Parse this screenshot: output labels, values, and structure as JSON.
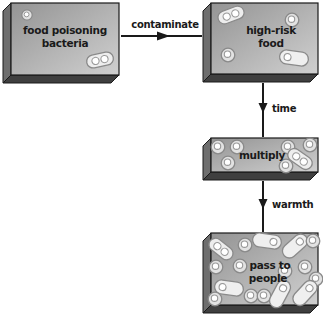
{
  "diagram": {
    "type": "flowchart",
    "nodes": [
      {
        "id": "food-poisoning-bacteria",
        "lines": [
          "food poisoning",
          "bacteria"
        ],
        "bacteria_count": 2
      },
      {
        "id": "high-risk-food",
        "lines": [
          "high-risk",
          "food"
        ],
        "bacteria_count": 4
      },
      {
        "id": "multiply",
        "lines": [
          "multiply"
        ],
        "bacteria_count": 7
      },
      {
        "id": "pass-to-people",
        "lines": [
          "pass to",
          "people"
        ],
        "bacteria_count": 16
      }
    ],
    "edges": [
      {
        "id": "contaminate",
        "label": "contaminate",
        "from": "food-poisoning-bacteria",
        "to": "high-risk-food"
      },
      {
        "id": "time",
        "label": "time",
        "from": "high-risk-food",
        "to": "multiply"
      },
      {
        "id": "warmth",
        "label": "warmth",
        "from": "multiply",
        "to": "pass-to-people"
      }
    ],
    "colors": {
      "background": "#ffffff",
      "box_face_start": "#949494",
      "box_face_end": "#d0d0d0",
      "box_side": "#6e6e6e",
      "box_bottom": "#3f3f3f",
      "outline": "#1a1a1a",
      "text": "#1a1a1a",
      "bacteria_fill": "#e2e2e2",
      "bacteria_stroke": "#8a8a8a",
      "bacteria_inner": "#ffffff"
    }
  }
}
